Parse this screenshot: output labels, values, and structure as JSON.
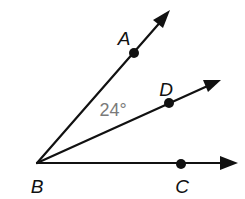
{
  "diagram": {
    "type": "geometry-angles",
    "vertex": {
      "label": "B",
      "x": 37,
      "y": 163,
      "label_x": 37,
      "label_y": 186
    },
    "rays": [
      {
        "name": "BA",
        "through": "A",
        "tip_x": 170,
        "tip_y": 10
      },
      {
        "name": "BD",
        "through": "D",
        "tip_x": 221,
        "tip_y": 80
      },
      {
        "name": "BC",
        "through": "C",
        "tip_x": 238,
        "tip_y": 163
      }
    ],
    "points": [
      {
        "label": "A",
        "x": 134,
        "y": 53,
        "label_x": 124,
        "label_y": 38
      },
      {
        "label": "D",
        "x": 169,
        "y": 103,
        "label_x": 166,
        "label_y": 89
      },
      {
        "label": "C",
        "x": 181,
        "y": 164,
        "label_x": 182,
        "label_y": 186
      }
    ],
    "angle_label": {
      "text": "24°",
      "between": [
        "BA",
        "BD"
      ],
      "x": 113,
      "y": 110,
      "color": "#7a7a7a"
    },
    "line_color": "#111111"
  }
}
